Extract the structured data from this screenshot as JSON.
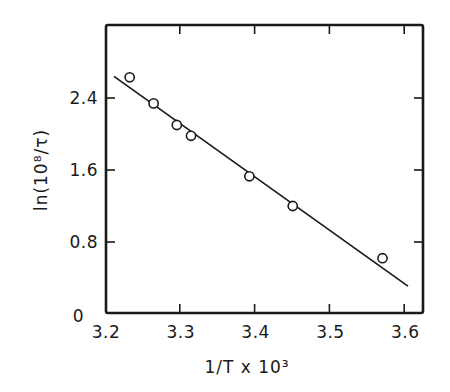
{
  "chart_data": {
    "type": "scatter",
    "title": "",
    "xlabel": "1/T x 10³",
    "ylabel": "ln(10⁸/τ)",
    "xlim": [
      3.2,
      3.627
    ],
    "ylim": [
      0,
      3.2
    ],
    "x_ticks": [
      3.2,
      3.3,
      3.4,
      3.5,
      3.6
    ],
    "x_tick_labels": [
      "3.2",
      "3.3",
      "3.4",
      "3.5",
      "3.6"
    ],
    "y_ticks": [
      0,
      0.8,
      1.6,
      2.4
    ],
    "y_tick_labels": [
      "0",
      "0.8",
      "1.6",
      "2.4"
    ],
    "grid": false,
    "legend": null,
    "series": [
      {
        "name": "measured",
        "marker": "open-circle",
        "x": [
          3.233,
          3.265,
          3.296,
          3.315,
          3.393,
          3.451,
          3.571
        ],
        "y": [
          2.63,
          2.34,
          2.1,
          1.98,
          1.53,
          1.2,
          0.62
        ]
      },
      {
        "name": "linear fit",
        "marker": "line",
        "x": [
          3.212,
          3.605
        ],
        "y": [
          2.64,
          0.31
        ]
      }
    ],
    "colors": {
      "ink": "#1a1a1a",
      "background": "#ffffff"
    }
  }
}
